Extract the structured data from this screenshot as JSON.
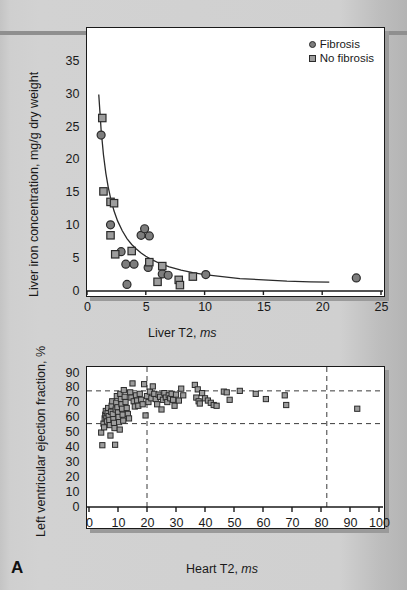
{
  "figure": {
    "panel_letter": "A",
    "background_color": "#cccccc",
    "marker_circle_color": "#7d7d7d",
    "marker_square_color": "#9d9d9d",
    "marker_edge_color": "#2b2b2b",
    "axis_color": "#1a1a1a"
  },
  "charts": [
    {
      "id": "liver",
      "type": "scatter",
      "title": "",
      "xlabel": "Liver T2,",
      "xlabel_unit": "ms",
      "ylabel": "Liver iron concentration,",
      "ylabel_unit": "mg/g dry weight",
      "xlim": [
        0,
        25
      ],
      "ylim": [
        0,
        38
      ],
      "xticks": [
        0,
        5,
        10,
        15,
        20,
        25
      ],
      "yticks": [
        0,
        5,
        10,
        15,
        20,
        25,
        30,
        35
      ],
      "grid": false,
      "legend_position": "top-right",
      "legend": [
        {
          "label": "Fibrosis",
          "marker": "circle"
        },
        {
          "label": "No fibrosis",
          "marker": "square"
        }
      ],
      "fit_curve": {
        "description": "inverse decay fit",
        "x_start": 1.0,
        "x_end": 20.6,
        "points": [
          [
            1.0,
            30.0
          ],
          [
            1.2,
            24.6
          ],
          [
            1.4,
            20.8
          ],
          [
            1.6,
            18.0
          ],
          [
            1.8,
            15.9
          ],
          [
            2.0,
            14.2
          ],
          [
            2.3,
            12.2
          ],
          [
            2.6,
            10.7
          ],
          [
            3.0,
            9.2
          ],
          [
            3.4,
            8.0
          ],
          [
            3.8,
            7.1
          ],
          [
            4.2,
            6.4
          ],
          [
            4.6,
            5.8
          ],
          [
            5.0,
            5.3
          ],
          [
            5.6,
            4.7
          ],
          [
            6.2,
            4.2
          ],
          [
            7.0,
            3.7
          ],
          [
            8.0,
            3.2
          ],
          [
            9.0,
            2.8
          ],
          [
            10.0,
            2.5
          ],
          [
            11.5,
            2.2
          ],
          [
            13.0,
            1.9
          ],
          [
            15.0,
            1.7
          ],
          [
            17.0,
            1.5
          ],
          [
            19.0,
            1.4
          ],
          [
            20.6,
            1.35
          ]
        ]
      },
      "series": [
        {
          "name": "Fibrosis",
          "marker": "circle",
          "points": [
            [
              1.2,
              23.8
            ],
            [
              2.0,
              10.1
            ],
            [
              2.9,
              6.0
            ],
            [
              3.3,
              4.1
            ],
            [
              4.0,
              4.1
            ],
            [
              4.6,
              8.5
            ],
            [
              4.9,
              9.5
            ],
            [
              5.3,
              8.4
            ],
            [
              5.2,
              3.6
            ],
            [
              6.4,
              2.6
            ],
            [
              6.9,
              2.4
            ],
            [
              3.4,
              1.0
            ],
            [
              10.1,
              2.5
            ],
            [
              22.9,
              2.0
            ]
          ]
        },
        {
          "name": "No fibrosis",
          "marker": "square",
          "points": [
            [
              1.3,
              26.4
            ],
            [
              1.4,
              15.2
            ],
            [
              2.0,
              13.6
            ],
            [
              2.3,
              13.4
            ],
            [
              2.0,
              8.5
            ],
            [
              2.4,
              5.6
            ],
            [
              3.8,
              6.1
            ],
            [
              5.3,
              4.4
            ],
            [
              6.4,
              3.8
            ],
            [
              6.0,
              1.4
            ],
            [
              7.8,
              1.7
            ],
            [
              7.9,
              0.9
            ],
            [
              9.0,
              2.2
            ]
          ]
        }
      ]
    },
    {
      "id": "heart",
      "type": "scatter",
      "title": "",
      "xlabel": "Heart T2,",
      "xlabel_unit": "ms",
      "ylabel": "Left ventricular ejection fraction, %",
      "ylabel_unit": "",
      "xlim": [
        0,
        100
      ],
      "ylim": [
        0,
        90
      ],
      "xticks": [
        0,
        10,
        20,
        30,
        40,
        50,
        60,
        70,
        80,
        90,
        100
      ],
      "yticks": [
        0,
        10,
        20,
        30,
        40,
        50,
        60,
        70,
        80,
        90
      ],
      "grid": false,
      "reference_lines": {
        "horizontal": [
          56,
          78
        ],
        "vertical": [
          20,
          82
        ]
      },
      "series": [
        {
          "name": "Patients",
          "marker": "square",
          "points": [
            [
              4.2,
              50.0
            ],
            [
              4.6,
              41.5
            ],
            [
              5.0,
              56.0
            ],
            [
              5.2,
              53.5
            ],
            [
              5.4,
              59.5
            ],
            [
              5.6,
              62.0
            ],
            [
              5.8,
              64.5
            ],
            [
              6.0,
              60.0
            ],
            [
              6.2,
              57.5
            ],
            [
              6.4,
              63.0
            ],
            [
              6.6,
              66.5
            ],
            [
              6.8,
              61.0
            ],
            [
              7.0,
              58.5
            ],
            [
              7.2,
              55.0
            ],
            [
              7.4,
              48.0
            ],
            [
              7.6,
              64.0
            ],
            [
              7.8,
              68.0
            ],
            [
              8.0,
              71.0
            ],
            [
              8.2,
              62.5
            ],
            [
              8.4,
              59.0
            ],
            [
              8.6,
              56.5
            ],
            [
              8.8,
              53.0
            ],
            [
              9.0,
              41.8
            ],
            [
              9.2,
              65.5
            ],
            [
              9.4,
              70.0
            ],
            [
              9.6,
              74.5
            ],
            [
              9.8,
              67.0
            ],
            [
              10.0,
              63.5
            ],
            [
              10.2,
              60.5
            ],
            [
              10.4,
              57.0
            ],
            [
              10.6,
              52.0
            ],
            [
              10.8,
              76.0
            ],
            [
              11.0,
              72.5
            ],
            [
              11.2,
              69.0
            ],
            [
              11.4,
              66.0
            ],
            [
              11.6,
              62.0
            ],
            [
              11.8,
              58.0
            ],
            [
              12.0,
              78.5
            ],
            [
              12.3,
              74.0
            ],
            [
              12.6,
              70.5
            ],
            [
              13.0,
              66.5
            ],
            [
              13.4,
              62.5
            ],
            [
              13.8,
              59.5
            ],
            [
              14.2,
              77.0
            ],
            [
              14.6,
              73.5
            ],
            [
              15.0,
              83.0
            ],
            [
              15.4,
              71.0
            ],
            [
              15.8,
              67.5
            ],
            [
              16.2,
              75.0
            ],
            [
              16.6,
              71.5
            ],
            [
              17.0,
              68.0
            ],
            [
              17.5,
              76.0
            ],
            [
              18.0,
              72.0
            ],
            [
              18.5,
              69.0
            ],
            [
              19.0,
              82.5
            ],
            [
              19.5,
              61.5
            ],
            [
              20.0,
              74.5
            ],
            [
              20.5,
              70.5
            ],
            [
              21.0,
              77.5
            ],
            [
              21.5,
              73.0
            ],
            [
              22.0,
              81.0
            ],
            [
              22.5,
              76.0
            ],
            [
              23.0,
              72.5
            ],
            [
              23.5,
              69.0
            ],
            [
              24.0,
              75.5
            ],
            [
              24.5,
              74.0
            ],
            [
              25.0,
              65.5
            ],
            [
              25.5,
              72.0
            ],
            [
              26.0,
              76.5
            ],
            [
              26.5,
              73.5
            ],
            [
              27.0,
              70.5
            ],
            [
              27.5,
              75.0
            ],
            [
              28.0,
              73.0
            ],
            [
              28.5,
              76.0
            ],
            [
              29.0,
              72.0
            ],
            [
              29.5,
              68.0
            ],
            [
              30.0,
              75.5
            ],
            [
              31.0,
              71.5
            ],
            [
              31.8,
              79.5
            ],
            [
              32.5,
              75.0
            ],
            [
              36.5,
              82.0
            ],
            [
              37.0,
              73.5
            ],
            [
              37.5,
              79.0
            ],
            [
              37.8,
              71.0
            ],
            [
              38.2,
              69.5
            ],
            [
              39.0,
              76.5
            ],
            [
              40.0,
              73.0
            ],
            [
              41.0,
              71.5
            ],
            [
              42.0,
              70.0
            ],
            [
              43.0,
              68.5
            ],
            [
              44.0,
              68.0
            ],
            [
              46.5,
              77.5
            ],
            [
              47.5,
              77.0
            ],
            [
              48.5,
              72.0
            ],
            [
              52.0,
              78.0
            ],
            [
              57.5,
              76.0
            ],
            [
              61.0,
              72.5
            ],
            [
              67.5,
              75.0
            ],
            [
              68.0,
              68.5
            ],
            [
              92.5,
              66.0
            ]
          ]
        }
      ]
    }
  ]
}
